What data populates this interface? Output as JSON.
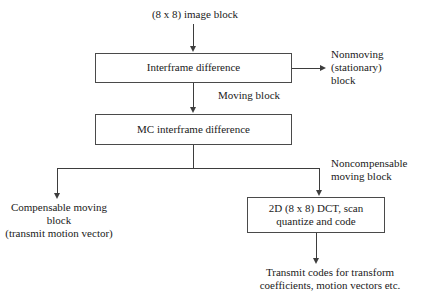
{
  "diagram": {
    "input_label": "(8 x 8) image block",
    "boxes": [
      {
        "id": "interframe-difference",
        "label": "Interframe difference"
      },
      {
        "id": "mc-interframe-difference",
        "label": "MC interframe difference"
      },
      {
        "id": "dct-quantize-code",
        "line1": "2D (8 x 8) DCT, scan",
        "line2": "quantize and code"
      }
    ],
    "labels": {
      "nonmoving_line1": "Nonmoving",
      "nonmoving_line2": "(stationary)",
      "nonmoving_line3": "block",
      "moving_block": "Moving block",
      "noncompensable_line1": "Noncompensable",
      "noncompensable_line2": "moving block",
      "compensable_line1": "Compensable moving",
      "compensable_line2": "block",
      "compensable_line3": "(transmit motion vector)",
      "transmit_line1": "Transmit codes for transform",
      "transmit_line2": "coefficients, motion vectors etc."
    },
    "colors": {
      "line": "#3d3d3d",
      "box_border": "#4a4a4a",
      "text": "#1a1a1a",
      "background": "#ffffff"
    }
  }
}
